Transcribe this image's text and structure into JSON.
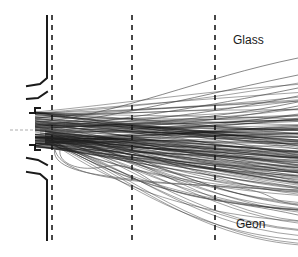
{
  "figure": {
    "labels": {
      "top": "Glass",
      "bottom": "Geon"
    },
    "colors": {
      "background": "#ffffff",
      "wall": "#1a1a1a",
      "dashed": "#1a1a1a",
      "trajectory_dense": "#111111",
      "trajectory_light": "#555555"
    },
    "dashed_lines_x": [
      52,
      132,
      215
    ],
    "trajectory_origin": {
      "x": 35,
      "y": 130
    },
    "trajectory_end_x": 298
  }
}
